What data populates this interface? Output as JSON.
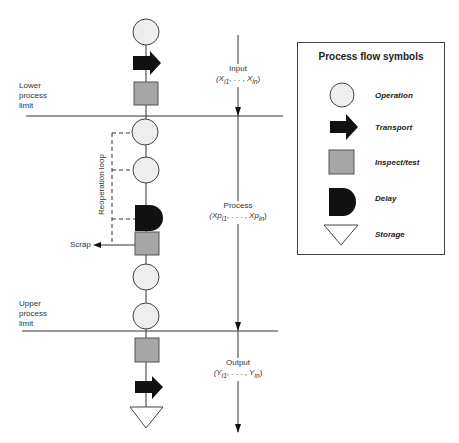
{
  "diagram": {
    "limits": {
      "lower": [
        "Lower",
        "process",
        "limit"
      ],
      "upper": [
        "Upper",
        "process",
        "limit"
      ]
    },
    "axis": {
      "input": {
        "label": "Input",
        "range": "(X",
        "sub1": "i1",
        "sep": ", . . ,",
        "var2": "X",
        "sub2": "in",
        "close": ")"
      },
      "process": {
        "label": "Process",
        "range": "(Xp",
        "sub1": "i1",
        "sep": ", . . . ,",
        "var2": "Xp",
        "sub2": "in",
        "close": ")"
      },
      "output": {
        "label": "Output",
        "range": "(Y",
        "sub1": "i1",
        "sep": ", . . . ,",
        "var2": "Y",
        "sub2": "in",
        "close": ")"
      }
    },
    "loop_label": "Reoperation loop",
    "scrap_label": "Scrap",
    "flow_sequence": [
      "operation",
      "transport",
      "inspect",
      "operation",
      "operation",
      "delay",
      "inspect",
      "operation",
      "operation",
      "inspect",
      "transport",
      "storage"
    ],
    "colors": {
      "operation_fill": "#eeeeee",
      "inspect_fill": "#a6a6a6",
      "black": "#111111",
      "line": "#333333"
    }
  },
  "legend": {
    "title": "Process flow symbols",
    "items": [
      {
        "symbol": "circle",
        "label": "Operation"
      },
      {
        "symbol": "arrow",
        "label": "Transport"
      },
      {
        "symbol": "square",
        "label": "Inspect/test"
      },
      {
        "symbol": "d-shape",
        "label": "Delay"
      },
      {
        "symbol": "triangle",
        "label": "Storage"
      }
    ]
  }
}
